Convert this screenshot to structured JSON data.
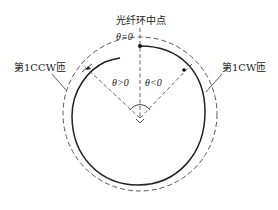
{
  "diagram": {
    "title_label": "光纤环中点",
    "theta_zero": "θ=0",
    "theta_positive": "θ>0",
    "theta_negative": "θ<0",
    "ccw_label": "第1CCW匝",
    "cw_label": "第1CW匝",
    "colors": {
      "line": "#333333",
      "dashed": "#555555",
      "background": "#ffffff"
    },
    "geometry": {
      "center": [
        140,
        115
      ],
      "outer_dashed_radius": 77,
      "inner_solid_radius": 68
    }
  }
}
